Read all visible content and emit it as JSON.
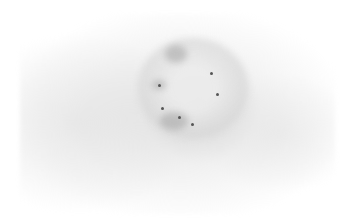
{
  "image": {
    "description": "Grayscale inverted fluorescence microscopy image of a single cell with a round nucleus containing several dark puncta",
    "colors": {
      "background": "#ffffff",
      "cytoplasm": "#e0e0e0",
      "nucleus_blobs": "#969696",
      "puncta": "#555555"
    }
  }
}
